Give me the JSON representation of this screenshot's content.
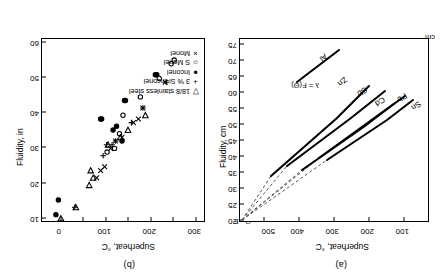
{
  "figure": {
    "orientation_note": "rotated-180",
    "panels": [
      {
        "id": "a",
        "label": "(a)",
        "axis_marker": "Θ - F"
      },
      {
        "id": "b",
        "label": "(b)"
      }
    ]
  },
  "panel_a": {
    "label": "(a)",
    "xlabel": "Superheat, °C",
    "ylabel": "Fluidity, cm",
    "unit_marker": "cm",
    "corner_marker": "Θ - F",
    "annotation": "λ = F(Θ)",
    "xticks": [
      "100",
      "200",
      "300",
      "400",
      "500"
    ],
    "yticks": [
      "20",
      "25",
      "30",
      "35",
      "40",
      "45",
      "50",
      "55",
      "60",
      "65",
      "70",
      "75"
    ],
    "series_labels": [
      "Sn",
      "Pb",
      "Cd",
      "Sb",
      "Zn",
      "Al"
    ]
  },
  "panel_b": {
    "label": "(b)",
    "xlabel": "Superheat, °C",
    "ylabel": "Fluidity, in",
    "xticks": [
      "0",
      "100",
      "200",
      "300"
    ],
    "yticks": [
      "10",
      "20",
      "30",
      "40",
      "50",
      "60"
    ],
    "legend": [
      {
        "symbol": "▽",
        "label": "18/8 stainless steel"
      },
      {
        "symbol": "+",
        "label": "3 % Si-Inconel"
      },
      {
        "symbol": "●",
        "label": "Inconel"
      },
      {
        "symbol": "○",
        "label": "S Monel"
      },
      {
        "symbol": "×",
        "label": "Monel"
      }
    ]
  },
  "chart_data": [
    {
      "type": "line",
      "id": "panel-a",
      "title": "(a)",
      "xlabel": "Superheat, °C",
      "ylabel": "Fluidity, cm",
      "xlim": [
        0,
        560
      ],
      "ylim": [
        20,
        75
      ],
      "y_inverted": true,
      "grid": false,
      "legend": "inline-labels",
      "annotations": [
        "λ = F(Θ)",
        "Θ - F",
        "cm"
      ],
      "series": [
        {
          "name": "Sn",
          "x": [
            0,
            110,
            300
          ],
          "y": [
            20,
            33,
            50
          ],
          "dashed_extension": {
            "x": [
              0,
              0
            ],
            "y": [
              20,
              20
            ]
          }
        },
        {
          "name": "Pb",
          "x": [
            0,
            115,
            290
          ],
          "y": [
            20,
            34,
            50
          ],
          "dashed_extension": {
            "x": [
              0,
              0
            ],
            "y": [
              20,
              20
            ]
          }
        },
        {
          "name": "Cd",
          "x": [
            0,
            110,
            255
          ],
          "y": [
            20,
            37,
            52
          ],
          "dashed_extension": {
            "x": [
              0,
              0
            ],
            "y": [
              20,
              20
            ]
          }
        },
        {
          "name": "Sb",
          "x": [
            0,
            120,
            235
          ],
          "y": [
            20,
            39,
            55
          ],
          "dashed_extension": {
            "x": [
              0,
              0
            ],
            "y": [
              20,
              20
            ]
          }
        },
        {
          "name": "Zn",
          "x": [
            0,
            120,
            215
          ],
          "y": [
            20,
            44,
            62
          ],
          "dashed_extension": {
            "x": [
              0,
              0
            ],
            "y": [
              20,
              20
            ]
          }
        },
        {
          "name": "Al",
          "x": [
            95,
            180
          ],
          "y": [
            60,
            74
          ],
          "dashed_extension": null
        }
      ]
    },
    {
      "type": "scatter",
      "id": "panel-b",
      "title": "(b)",
      "xlabel": "Superheat, °C",
      "ylabel": "Fluidity, in",
      "xlim": [
        0,
        330
      ],
      "ylim": [
        10,
        60
      ],
      "y_inverted": true,
      "grid": false,
      "legend_position": "lower-right",
      "series": [
        {
          "name": "18/8 stainless steel",
          "marker": "triangle-down-open",
          "points": [
            [
              40,
              11
            ],
            [
              70,
              14
            ],
            [
              97,
              20
            ],
            [
              105,
              22
            ],
            [
              100,
              24
            ],
            [
              135,
              31
            ],
            [
              160,
              33
            ],
            [
              175,
              35
            ],
            [
              210,
              39
            ]
          ]
        },
        {
          "name": "3 % Si-Inconel",
          "marker": "plus",
          "points": [
            [
              68,
              14
            ],
            [
              125,
              28
            ],
            [
              132,
              31
            ],
            [
              143,
              31
            ],
            [
              150,
              32
            ],
            [
              182,
              37
            ],
            [
              205,
              41
            ],
            [
              252,
              48
            ]
          ]
        },
        {
          "name": "Inconel",
          "marker": "circle-filled",
          "points": [
            [
              30,
              12
            ],
            [
              35,
              16
            ],
            [
              163,
              32
            ],
            [
              145,
              35
            ],
            [
              152,
              36
            ],
            [
              120,
              38
            ],
            [
              122,
              38
            ],
            [
              168,
              43
            ],
            [
              170,
              43
            ],
            [
              230,
              50
            ],
            [
              233,
              50
            ]
          ]
        },
        {
          "name": "S Monel",
          "marker": "circle-open",
          "points": [
            [
              133,
              29
            ],
            [
              148,
              30
            ],
            [
              158,
              34
            ],
            [
              165,
              39
            ],
            [
              200,
              44
            ],
            [
              238,
              49
            ],
            [
              262,
              53
            ],
            [
              268,
              54
            ]
          ]
        },
        {
          "name": "Monel",
          "marker": "cross",
          "points": [
            [
              112,
              22
            ],
            [
              120,
              24
            ],
            [
              128,
              25
            ],
            [
              140,
              30
            ],
            [
              150,
              32
            ],
            [
              163,
              33
            ],
            [
              186,
              37
            ],
            [
              196,
              38
            ],
            [
              205,
              41
            ],
            [
              250,
              48
            ]
          ]
        }
      ]
    }
  ]
}
